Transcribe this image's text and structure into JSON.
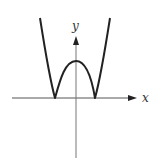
{
  "diagram": {
    "type": "function-graph",
    "axes": {
      "x_label": "x",
      "y_label": "y"
    },
    "colors": {
      "curve": "#222222",
      "axis": "#666666",
      "background": "#ffffff"
    },
    "features": {
      "zeros": [
        "left touch point",
        "right touch point"
      ],
      "local_max": "on y-axis above origin",
      "symmetry": "even function"
    }
  }
}
